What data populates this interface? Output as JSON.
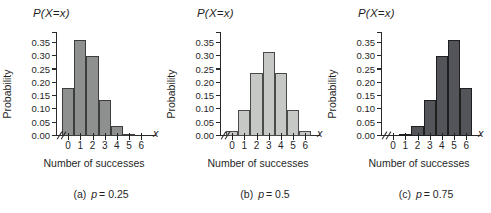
{
  "figure": {
    "background_color": "#ffffff",
    "text_color": "#1f1f1f",
    "axis_color": "#2a2a2a",
    "y_tick_labels": [
      "0.00",
      "0.05",
      "0.10",
      "0.15",
      "0.20",
      "0.25",
      "0.30",
      "0.35"
    ],
    "x_tick_labels": [
      "0",
      "1",
      "2",
      "3",
      "4",
      "5",
      "6"
    ],
    "x_axis_letter": "x"
  },
  "chart_data": [
    {
      "type": "bar",
      "panel": "a",
      "title": "P(X=x)",
      "ylabel": "Probability",
      "xlabel": "Number of successes",
      "caption_prefix": "(a)",
      "caption_var": "p",
      "caption_value": "= 0.25",
      "p": 0.25,
      "categories": [
        0,
        1,
        2,
        3,
        4,
        5,
        6
      ],
      "values": [
        0.178,
        0.356,
        0.297,
        0.132,
        0.033,
        0.004,
        0.0
      ],
      "ylim": [
        0,
        0.35
      ],
      "y_tick_step": 0.05,
      "grid": false,
      "bar_color": "#8e908f",
      "bar_border_color": "#3d3d3d"
    },
    {
      "type": "bar",
      "panel": "b",
      "title": "P(X=x)",
      "ylabel": "Probability",
      "xlabel": "Number of successes",
      "caption_prefix": "(b)",
      "caption_var": "p",
      "caption_value": "= 0.5",
      "p": 0.5,
      "categories": [
        0,
        1,
        2,
        3,
        4,
        5,
        6
      ],
      "values": [
        0.016,
        0.094,
        0.234,
        0.313,
        0.234,
        0.094,
        0.016
      ],
      "ylim": [
        0,
        0.35
      ],
      "y_tick_step": 0.05,
      "grid": false,
      "bar_color": "#c6c8c6",
      "bar_border_color": "#4a4a4a"
    },
    {
      "type": "bar",
      "panel": "c",
      "title": "P(X=x)",
      "ylabel": "Probability",
      "xlabel": "Number of successes",
      "caption_prefix": "(c)",
      "caption_var": "p",
      "caption_value": "= 0.75",
      "p": 0.75,
      "categories": [
        0,
        1,
        2,
        3,
        4,
        5,
        6
      ],
      "values": [
        0.0,
        0.004,
        0.033,
        0.132,
        0.297,
        0.356,
        0.178
      ],
      "ylim": [
        0,
        0.35
      ],
      "y_tick_step": 0.05,
      "grid": false,
      "bar_color": "#53555a",
      "bar_border_color": "#1e1e1e"
    }
  ]
}
